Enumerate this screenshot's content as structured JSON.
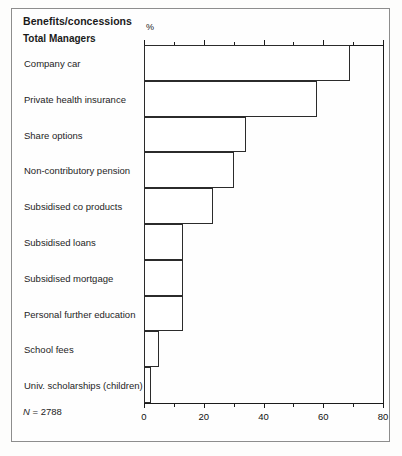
{
  "header": {
    "title": "Benefits/concessions",
    "series_title": "Total Managers",
    "unit_label": "%"
  },
  "footnote": {
    "n_symbol": "N",
    "n_text": " = 2788"
  },
  "colors": {
    "bar_fill": "#ffffff",
    "bar_stroke": "#2b2b2b",
    "axis": "#1b1b1b",
    "frame": "#8d8d8d",
    "text": "#1d1d1d",
    "page_background": "#fdfdfc"
  },
  "chart_data": {
    "type": "bar",
    "orientation": "horizontal",
    "title": "Benefits/concessions",
    "subtitle": "Total Managers",
    "xlabel": "%",
    "ylabel": "",
    "xlim": [
      0,
      80
    ],
    "grid": false,
    "legend": null,
    "sample_size": 2788,
    "major_ticks": [
      0,
      20,
      40,
      60,
      80
    ],
    "minor_ticks": [
      10,
      30,
      50,
      70
    ],
    "tick_labels": [
      "0",
      "20",
      "40",
      "60",
      "80"
    ],
    "categories": [
      "Company car",
      "Private health insurance",
      "Share options",
      "Non-contributory pension",
      "Subsidised co products",
      "Subsidised loans",
      "Subsidised mortgage",
      "Personal further education",
      "School fees",
      "Univ. scholarships (children)"
    ],
    "values": [
      69,
      58,
      34,
      30,
      23,
      13,
      13,
      13,
      5,
      2.5
    ]
  }
}
